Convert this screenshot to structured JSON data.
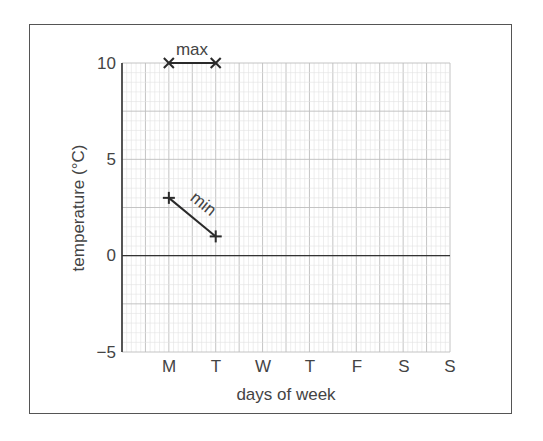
{
  "chart_data": {
    "type": "line",
    "title": "",
    "xlabel": "days of week",
    "ylabel": "temperature (°C)",
    "categories": [
      "M",
      "T",
      "W",
      "T",
      "F",
      "S",
      "S"
    ],
    "ylim": [
      -5,
      10
    ],
    "yticks": [
      -5,
      0,
      5,
      10
    ],
    "grid": true,
    "series": [
      {
        "name": "max",
        "values": [
          10,
          10,
          null,
          null,
          null,
          null,
          null
        ],
        "marker": "x"
      },
      {
        "name": "min",
        "values": [
          3,
          1,
          null,
          null,
          null,
          null,
          null
        ],
        "marker": "+"
      }
    ]
  },
  "labels": {
    "xlabel": "days of week",
    "ylabel": "temperature (°C)",
    "series_max": "max",
    "series_min": "min",
    "yticks": [
      "10",
      "5",
      "0",
      "−5"
    ],
    "xticks": [
      "M",
      "T",
      "W",
      "T",
      "F",
      "S",
      "S"
    ]
  },
  "colors": {
    "frame": "#555555",
    "axis": "#333333",
    "grid_major": "#bdbdbd",
    "grid_minor": "#e2e2e2",
    "line": "#2a2a2a"
  }
}
